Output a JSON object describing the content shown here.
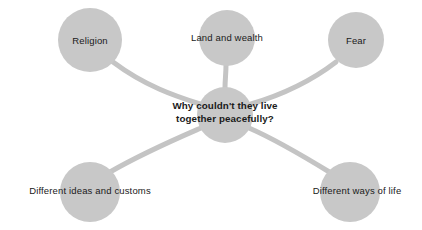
{
  "diagram": {
    "type": "mind-map",
    "background_color": "#ffffff",
    "node_color": "#c8c8c8",
    "connector_color": "#c4c4c4",
    "text_color": "#1a1a1a",
    "center": {
      "id": "center",
      "line1": "Why couldn't they live",
      "line2": "together peacefully?",
      "full_text": "Why couldn't they live together peacefully?",
      "cx": 225,
      "cy": 115,
      "r": 28,
      "label_cx": 225,
      "label_cy": 113
    },
    "branches": [
      {
        "id": "religion",
        "label": "Religion",
        "cx": 90,
        "cy": 40,
        "r": 32,
        "label_cx": 90,
        "label_cy": 41
      },
      {
        "id": "land-and-wealth",
        "label": "Land and wealth",
        "cx": 227,
        "cy": 38,
        "r": 28,
        "label_cx": 227,
        "label_cy": 38
      },
      {
        "id": "fear",
        "label": "Fear",
        "cx": 356,
        "cy": 40,
        "r": 28,
        "label_cx": 356,
        "label_cy": 41
      },
      {
        "id": "different-ideas-and-customs",
        "label": "Different ideas and customs",
        "cx": 90,
        "cy": 192,
        "r": 30,
        "label_cx": 90,
        "label_cy": 191
      },
      {
        "id": "different-ways-of-life",
        "label": "Different ways of life",
        "cx": 350,
        "cy": 192,
        "r": 30,
        "label_cx": 357,
        "label_cy": 191
      }
    ],
    "connectors": [
      {
        "id": "connector-religion",
        "from": "religion",
        "to": "center",
        "path": "M 113 62 C 145 86 175 96 200 104"
      },
      {
        "id": "connector-land-and-wealth",
        "from": "land-and-wealth",
        "to": "center",
        "path": "M 226 65 C 226 74 225 80 225 88"
      },
      {
        "id": "connector-fear",
        "from": "fear",
        "to": "center",
        "path": "M 336 62 C 310 82 278 96 251 104"
      },
      {
        "id": "connector-different-ideas-and-customs",
        "from": "different-ideas-and-customs",
        "to": "center",
        "path": "M 110 172 C 145 152 178 138 201 128"
      },
      {
        "id": "connector-different-ways-of-life",
        "from": "different-ways-of-life",
        "to": "center",
        "path": "M 331 173 C 300 154 272 138 249 128"
      }
    ]
  }
}
